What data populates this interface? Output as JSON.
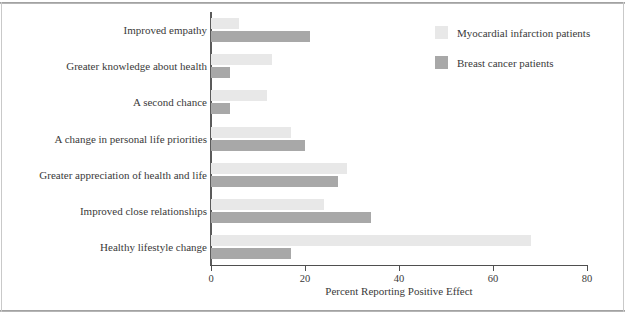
{
  "chart_data": {
    "type": "bar",
    "orientation": "horizontal",
    "title": "",
    "subtitle": "",
    "xlabel": "Percent Reporting Positive Effect",
    "ylabel": "",
    "xlim": [
      0,
      80
    ],
    "xticks": [
      0,
      20,
      40,
      60,
      80
    ],
    "xtick_labels": [
      "0",
      "20",
      "40",
      "60",
      "80"
    ],
    "grid": false,
    "legend_position": "top-right",
    "categories": [
      "Improved empathy",
      "Greater knowledge about health",
      "A second chance",
      "A change in personal life priorities",
      "Greater appreciation of health and life",
      "Improved close relationships",
      "Healthy lifestyle change"
    ],
    "series": [
      {
        "name": "Myocardial infarction patients",
        "color": "#e8e8e8",
        "values": [
          6,
          13,
          12,
          17,
          29,
          24,
          68
        ]
      },
      {
        "name": "Breast cancer patients",
        "color": "#a8a8a8",
        "values": [
          21,
          4,
          4,
          20,
          27,
          34,
          17
        ]
      }
    ]
  },
  "legend": {
    "entries": [
      {
        "label": "Myocardial infarction patients",
        "swatch": "light"
      },
      {
        "label": "Breast cancer patients",
        "swatch": "dark"
      }
    ]
  },
  "axis": {
    "x_title": "Percent Reporting Positive Effect"
  }
}
